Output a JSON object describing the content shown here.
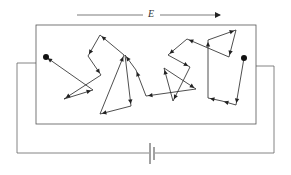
{
  "diagram": {
    "field_label": "E",
    "colors": {
      "line": "#333333",
      "background": "#ffffff",
      "frame": "#555555"
    },
    "conductor": {
      "x": 36,
      "y": 25,
      "width": 220,
      "height": 99
    },
    "field_arrow": {
      "x1": 77,
      "x2": 220,
      "y": 15,
      "label_x": 146
    },
    "start_point": {
      "x": 244,
      "y": 58
    },
    "end_point": {
      "x": 46,
      "y": 57
    },
    "path": [
      [
        244,
        58
      ],
      [
        236,
        105
      ],
      [
        222,
        101
      ],
      [
        208,
        98
      ],
      [
        208,
        40
      ],
      [
        236,
        30
      ],
      [
        229,
        57
      ],
      [
        187,
        39
      ],
      [
        168,
        55
      ],
      [
        190,
        67
      ],
      [
        173,
        101
      ],
      [
        164,
        68
      ],
      [
        196,
        89
      ],
      [
        146,
        96
      ],
      [
        136,
        70
      ],
      [
        125,
        55
      ],
      [
        131,
        106
      ],
      [
        100,
        114
      ],
      [
        124,
        55
      ],
      [
        100,
        35
      ],
      [
        88,
        56
      ],
      [
        101,
        75
      ],
      [
        64,
        99
      ],
      [
        93,
        90
      ],
      [
        46,
        57
      ]
    ],
    "battery": {
      "x": 150,
      "y": 153
    }
  }
}
